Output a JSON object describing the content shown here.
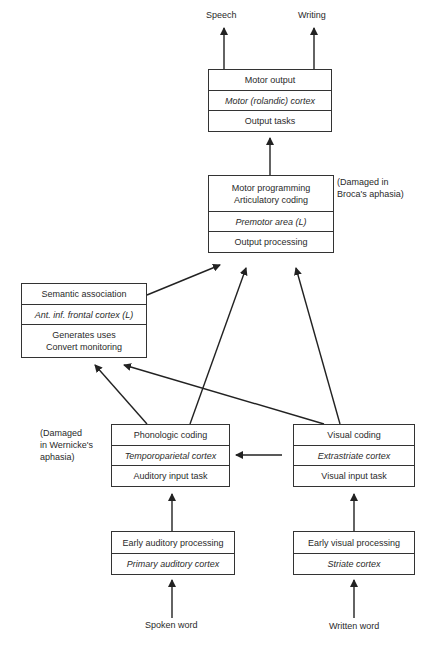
{
  "outputs": {
    "speech": "Speech",
    "writing": "Writing"
  },
  "boxes": {
    "motor_output": {
      "title": "Motor output",
      "region": "Motor (rolandic) cortex",
      "task": "Output tasks"
    },
    "motor_programming": {
      "title1": "Motor programming",
      "title2": "Articulatory coding",
      "region": "Premotor area (L)",
      "task": "Output processing"
    },
    "semantic": {
      "title": "Semantic association",
      "region": "Ant. inf. frontal cortex (L)",
      "task1": "Generates uses",
      "task2": "Convert monitoring"
    },
    "phonologic": {
      "title": "Phonologic coding",
      "region": "Temporoparietal cortex",
      "task": "Auditory input task"
    },
    "visual": {
      "title": "Visual coding",
      "region": "Extrastriate cortex",
      "task": "Visual input task"
    },
    "early_auditory": {
      "title": "Early auditory processing",
      "region": "Primary auditory cortex"
    },
    "early_visual": {
      "title": "Early visual processing",
      "region": "Striate cortex"
    }
  },
  "notes": {
    "broca1": "(Damaged in",
    "broca2": "Broca's aphasia)",
    "wernicke1": "(Damaged",
    "wernicke2": "in Wernicke's",
    "wernicke3": "aphasia)"
  },
  "inputs": {
    "spoken": "Spoken word",
    "written": "Written word"
  }
}
